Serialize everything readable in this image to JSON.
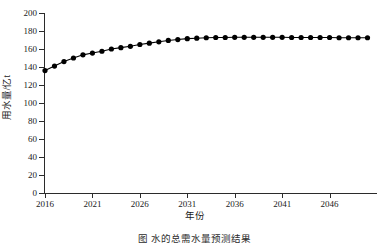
{
  "chart_data": {
    "type": "line",
    "title": "",
    "xlabel": "年份",
    "ylabel": "用水量/亿t",
    "xlim": [
      2016,
      2051
    ],
    "ylim": [
      0,
      200
    ],
    "grid": false,
    "legend": null,
    "marker": "filled-circle",
    "line_color": "#000000",
    "x_tick_labels": [
      "2016",
      "2021",
      "2026",
      "2031",
      "2036",
      "2041",
      "2046"
    ],
    "x_ticks": [
      2016,
      2021,
      2026,
      2031,
      2036,
      2041,
      2046
    ],
    "y_tick_labels": [
      "0",
      "20",
      "40",
      "60",
      "80",
      "100",
      "120",
      "140",
      "160",
      "180",
      "200"
    ],
    "y_ticks": [
      0,
      20,
      40,
      60,
      80,
      100,
      120,
      140,
      160,
      180,
      200
    ],
    "x": [
      2016,
      2017,
      2018,
      2019,
      2020,
      2021,
      2022,
      2023,
      2024,
      2025,
      2026,
      2027,
      2028,
      2029,
      2030,
      2031,
      2032,
      2033,
      2034,
      2035,
      2036,
      2037,
      2038,
      2039,
      2040,
      2041,
      2042,
      2043,
      2044,
      2045,
      2046,
      2047,
      2048,
      2049,
      2050
    ],
    "values": [
      136.0,
      141.0,
      146.0,
      150.0,
      153.5,
      155.5,
      157.5,
      160.0,
      161.5,
      163.0,
      165.0,
      166.5,
      168.0,
      169.5,
      170.5,
      171.5,
      172.0,
      172.5,
      172.8,
      172.8,
      173.0,
      173.0,
      173.0,
      173.0,
      173.0,
      173.0,
      172.8,
      172.8,
      172.8,
      172.8,
      172.8,
      172.5,
      172.5,
      172.5,
      172.5
    ]
  },
  "axes": {
    "x_title": "年份",
    "y_title": "用水量/亿t"
  },
  "caption": {
    "text": "图  水的总需水量预测结果"
  }
}
